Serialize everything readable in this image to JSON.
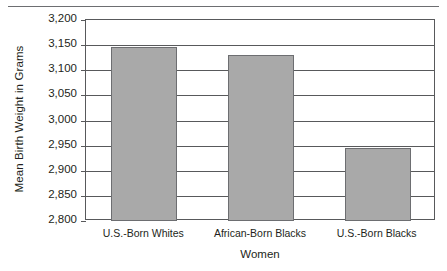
{
  "chart_data": {
    "type": "bar",
    "title": "",
    "xlabel": "Women",
    "ylabel": "Mean Birth Weight in Grams",
    "categories": [
      "U.S.-Born Whites",
      "African-Born Blacks",
      "U.S.-Born Blacks"
    ],
    "values": [
      3146,
      3130,
      2946
    ],
    "ylim": [
      2800,
      3200
    ],
    "ytick_step": 50,
    "ytick_labels": [
      "3,200",
      "3,150",
      "3,100",
      "3,050",
      "3,000",
      "2,950",
      "2,900",
      "2,850",
      "2,800"
    ],
    "ytick_values": [
      3200,
      3150,
      3100,
      3050,
      3000,
      2950,
      2900,
      2850,
      2800
    ],
    "grid": true,
    "legend": false,
    "series": [
      {
        "name": "Mean Birth Weight",
        "values": [
          3146,
          3130,
          2946
        ]
      }
    ],
    "colors": {
      "bar_fill": "#a9a9a9",
      "bar_border": "#6d6e71",
      "axis": "#58595b",
      "text": "#231f20",
      "rule": "#6d6e71"
    }
  }
}
